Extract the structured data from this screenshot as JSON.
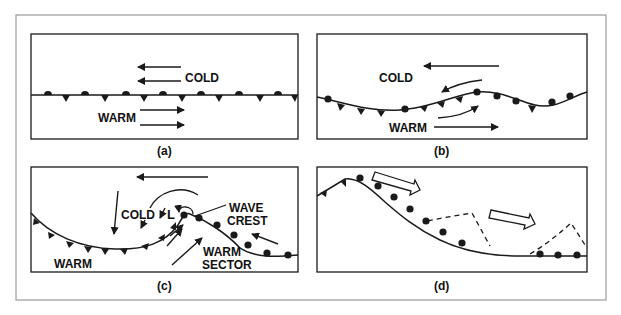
{
  "figure": {
    "colors": {
      "ink": "#1a1a1a",
      "frame": "#9a9a9a",
      "background": "#ffffff"
    },
    "panels": [
      {
        "id": "a",
        "caption": "(a)",
        "labels": {
          "cold": "COLD",
          "warm": "WARM"
        }
      },
      {
        "id": "b",
        "caption": "(b)",
        "labels": {
          "cold": "COLD",
          "warm": "WARM"
        }
      },
      {
        "id": "c",
        "caption": "(c)",
        "labels": {
          "cold": "COLD",
          "warm": "WARM",
          "low": "L",
          "wave_crest_1": "WAVE",
          "wave_crest_2": "CREST",
          "warm_sector_1": "WARM",
          "warm_sector_2": "SECTOR"
        }
      },
      {
        "id": "d",
        "caption": "(d)",
        "labels": {}
      }
    ]
  }
}
